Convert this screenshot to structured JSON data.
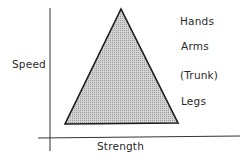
{
  "diagram": {
    "axes": {
      "y_label": "Speed",
      "x_label": "Strength"
    },
    "shape": "triangle",
    "fill_color": "#c8c8c8",
    "stroke_color": "#222222",
    "body_parts": [
      {
        "label": "Hands"
      },
      {
        "label": "Arms"
      },
      {
        "label": "(Trunk)"
      },
      {
        "label": "Legs"
      }
    ]
  }
}
